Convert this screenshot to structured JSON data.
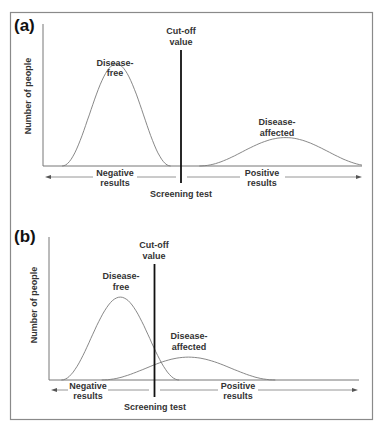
{
  "figure": {
    "colors": {
      "frame": "#8a8a8a",
      "axis": "#777777",
      "curve": "#7a7a7a",
      "cutoff": "#111111",
      "arrow": "#8a8a8a",
      "text": "#333333"
    },
    "panels": [
      {
        "id": "a",
        "label": "(a)",
        "y_axis_label": "Number of people",
        "x_axis_label": "Screening test",
        "cutoff_label_line1": "Cut-off",
        "cutoff_label_line2": "value",
        "negative_label_line1": "Negative",
        "negative_label_line2": "results",
        "positive_label_line1": "Positive",
        "positive_label_line2": "results",
        "curves": [
          {
            "name": "Disease-free",
            "label_line1": "Disease-",
            "label_line2": "free",
            "mean": 0.23,
            "spread": 0.17,
            "peak": 0.72
          },
          {
            "name": "Disease-affected",
            "label_line1": "Disease-",
            "label_line2": "affected",
            "mean": 0.76,
            "spread": 0.27,
            "peak": 0.2
          }
        ],
        "cutoff_position": 0.44,
        "overlap": false
      },
      {
        "id": "b",
        "label": "(b)",
        "y_axis_label": "Number of people",
        "x_axis_label": "Screening test",
        "cutoff_label_line1": "Cut-off",
        "cutoff_label_line2": "value",
        "negative_label_line1": "Negative",
        "negative_label_line2": "results",
        "positive_label_line1": "Positive",
        "positive_label_line2": "results",
        "curves": [
          {
            "name": "Disease-free",
            "label_line1": "Disease-",
            "label_line2": "free",
            "mean": 0.23,
            "spread": 0.19,
            "peak": 0.58
          },
          {
            "name": "Disease-affected",
            "label_line1": "Disease-",
            "label_line2": "affected",
            "mean": 0.45,
            "spread": 0.28,
            "peak": 0.16
          }
        ],
        "cutoff_position": 0.34,
        "overlap": true
      }
    ]
  }
}
